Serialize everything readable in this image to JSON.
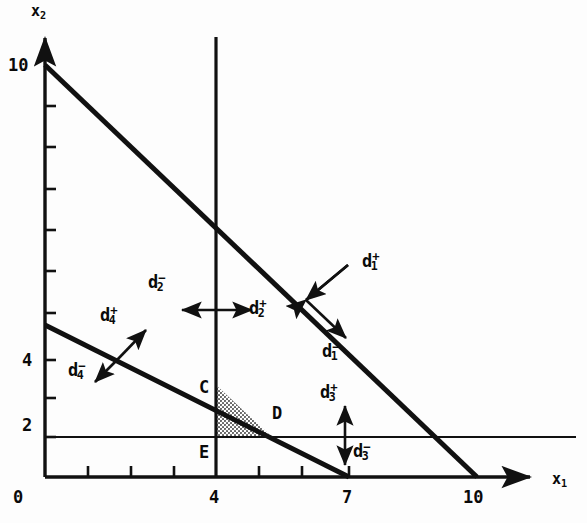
{
  "figure": {
    "type": "goal-programming-graph",
    "axes": {
      "x": {
        "name": "x",
        "sub": "1",
        "ticks": [
          {
            "value": "0",
            "px": 45,
            "labeled": true
          },
          {
            "value": "1",
            "px": 109,
            "labeled": false
          },
          {
            "value": "2",
            "px": 152,
            "labeled": false
          },
          {
            "value": "3",
            "px": 195,
            "labeled": false
          },
          {
            "value": "4",
            "px": 216,
            "labeled": true
          },
          {
            "value": "5",
            "px": 259,
            "labeled": false
          },
          {
            "value": "6",
            "px": 302,
            "labeled": false
          },
          {
            "value": "7",
            "px": 349,
            "labeled": true
          },
          {
            "value": "10",
            "px": 477,
            "labeled": true
          }
        ]
      },
      "y": {
        "name": "x",
        "sub": "2",
        "ticks": [
          {
            "value": "10",
            "px": 65,
            "labeled": true
          },
          {
            "value": "9",
            "px": 106,
            "labeled": false
          },
          {
            "value": "8",
            "px": 147,
            "labeled": false
          },
          {
            "value": "7",
            "px": 189,
            "labeled": false
          },
          {
            "value": "6",
            "px": 230,
            "labeled": false
          },
          {
            "value": "5",
            "px": 271,
            "labeled": false
          },
          {
            "value": "4",
            "px": 313,
            "labeled": false
          },
          {
            "value": "3",
            "px": 360,
            "labeled": true
          },
          {
            "value": "2",
            "px": 398,
            "labeled": false
          },
          {
            "value": "1",
            "px": 437,
            "labeled": true
          }
        ]
      }
    },
    "vertices": [
      {
        "id": "C",
        "label": "C",
        "x_px": 199,
        "y_px": 385
      },
      {
        "id": "D",
        "label": "D",
        "x_px": 272,
        "y_px": 411
      },
      {
        "id": "E",
        "label": "E",
        "x_px": 199,
        "y_px": 450
      }
    ],
    "deviation_labels": [
      {
        "id": "d1-plus",
        "base": "d",
        "sub": "1",
        "sup": "+",
        "x_px": 362,
        "y_px": 258
      },
      {
        "id": "d1-minus",
        "base": "d",
        "sub": "1",
        "sup": "−",
        "x_px": 322,
        "y_px": 348
      },
      {
        "id": "d2-minus",
        "base": "d",
        "sub": "2",
        "sup": "−",
        "x_px": 148,
        "y_px": 279
      },
      {
        "id": "d2-plus",
        "base": "d",
        "sub": "2",
        "sup": "+",
        "x_px": 249,
        "y_px": 305
      },
      {
        "id": "d3-plus",
        "base": "d",
        "sub": "3",
        "sup": "+",
        "x_px": 320,
        "y_px": 389
      },
      {
        "id": "d3-minus",
        "base": "d",
        "sub": "3",
        "sup": "−",
        "x_px": 349,
        "y_px": 448
      },
      {
        "id": "d4-plus",
        "base": "d",
        "sub": "4",
        "sup": "+",
        "x_px": 100,
        "y_px": 312
      },
      {
        "id": "d4-minus",
        "base": "d",
        "sub": "4",
        "sup": "−",
        "x_px": 71,
        "y_px": 367
      }
    ],
    "colors": {
      "ink": "#111111",
      "shade": "#9a9a9a",
      "paper": "#fdfdfd"
    },
    "constraint_lines": [
      {
        "id": "goal1",
        "from": [
          0,
          10
        ],
        "to": [
          10,
          0
        ],
        "weight": "heavy"
      },
      {
        "id": "goal4",
        "from": [
          0,
          3.7
        ],
        "to": [
          7,
          0
        ],
        "weight": "heavy"
      },
      {
        "id": "goal2",
        "desc": "vertical line at x1 = 4",
        "at": 4,
        "weight": "medium"
      },
      {
        "id": "goal3",
        "desc": "horizontal line at x2 = 1",
        "at": 1,
        "weight": "light"
      }
    ],
    "shaded_region": {
      "id": "feasible-triangle",
      "points": "C,D,E"
    }
  }
}
